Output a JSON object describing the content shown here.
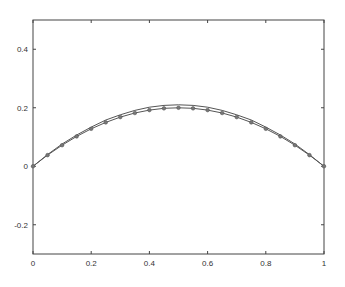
{
  "chart_data": {
    "type": "line",
    "title": "",
    "xlabel": "",
    "ylabel": "",
    "xlim": [
      0,
      1
    ],
    "ylim": [
      -0.3,
      0.5
    ],
    "grid": false,
    "legend": null,
    "x_ticks": [
      0,
      0.2,
      0.4,
      0.6,
      0.8,
      1
    ],
    "x_tick_labels": [
      "0",
      "0.2",
      "0.4",
      "0.6",
      "0.8",
      "1"
    ],
    "y_ticks": [
      -0.2,
      0,
      0.2,
      0.4
    ],
    "y_tick_labels": [
      "-0.2",
      "0",
      "0.2",
      "0.4"
    ],
    "series": [
      {
        "name": "solid curve",
        "style": "line",
        "color": "#555555",
        "x": [
          0,
          0.05,
          0.1,
          0.15,
          0.2,
          0.25,
          0.3,
          0.35,
          0.4,
          0.45,
          0.5,
          0.55,
          0.6,
          0.65,
          0.7,
          0.75,
          0.8,
          0.85,
          0.9,
          0.95,
          1
        ],
        "values": [
          0,
          0.04,
          0.076,
          0.107,
          0.134,
          0.158,
          0.176,
          0.191,
          0.202,
          0.208,
          0.21,
          0.208,
          0.202,
          0.191,
          0.176,
          0.158,
          0.134,
          0.107,
          0.076,
          0.04,
          0
        ]
      },
      {
        "name": "marker curve",
        "style": "line+markers",
        "color": "#555555",
        "x": [
          0,
          0.05,
          0.1,
          0.15,
          0.2,
          0.25,
          0.3,
          0.35,
          0.4,
          0.45,
          0.5,
          0.55,
          0.6,
          0.65,
          0.7,
          0.75,
          0.8,
          0.85,
          0.9,
          0.95,
          1
        ],
        "values": [
          0,
          0.038,
          0.072,
          0.102,
          0.128,
          0.15,
          0.168,
          0.182,
          0.192,
          0.198,
          0.2,
          0.198,
          0.192,
          0.182,
          0.168,
          0.15,
          0.128,
          0.102,
          0.072,
          0.038,
          0
        ]
      }
    ]
  },
  "plot_area": {
    "left": 33,
    "top": 20,
    "right": 324,
    "bottom": 254
  }
}
